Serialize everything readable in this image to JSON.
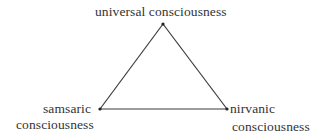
{
  "diagram": {
    "type": "triangle",
    "nodes": [
      {
        "id": "top",
        "label_lines": [
          "universal consciousness"
        ],
        "x": 163,
        "y": 24
      },
      {
        "id": "left",
        "label_lines": [
          "samsaric",
          "consciousness"
        ],
        "x": 100,
        "y": 109
      },
      {
        "id": "right",
        "label_lines": [
          "nirvanic",
          "consciousness"
        ],
        "x": 227,
        "y": 109
      }
    ],
    "edges": [
      {
        "from": "top",
        "to": "left"
      },
      {
        "from": "top",
        "to": "right"
      },
      {
        "from": "left",
        "to": "right"
      }
    ],
    "labels": {
      "top": "universal consciousness",
      "left_line1": "samsaric",
      "left_line2": "consciousness",
      "right_line1": "nirvanic",
      "right_line2": "consciousness"
    },
    "colors": {
      "line": "#3a3a3a",
      "text": "#333333",
      "background": "#ffffff"
    }
  }
}
